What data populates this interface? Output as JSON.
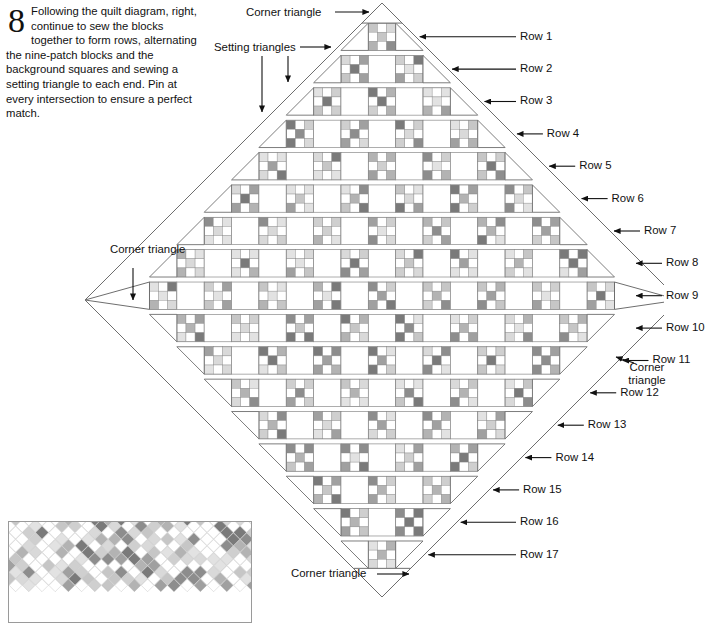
{
  "instruction": {
    "step_number": "8",
    "text": "Following the quilt diagram, right, continue to sew the blocks together to form rows, alternating the nine-patch blocks and the background squares and sewing a setting triangle to each end. Pin at every intersection to ensure a perfect match."
  },
  "annotations": {
    "corner_triangle_top": "Corner triangle",
    "setting_triangles": "Setting triangles",
    "corner_triangle_left": "Corner triangle",
    "corner_triangle_right": "Corner triangle",
    "corner_triangle_bottom": "Corner triangle"
  },
  "row_labels": [
    "Row 1",
    "Row 2",
    "Row 3",
    "Row 4",
    "Row 5",
    "Row 6",
    "Row 7",
    "Row 8",
    "Row 9",
    "Row 10",
    "Row 11",
    "Row 12",
    "Row 13",
    "Row 14",
    "Row 15",
    "Row 16",
    "Row 17"
  ],
  "colors": {
    "outline": "#6e6e6e",
    "block_outline": "#8a8a8a",
    "background_square": "#ffffff",
    "text": "#111111",
    "thumbnail_border": "#9a9a9a",
    "patch_palette": [
      "#d9d9d9",
      "#c6c6c6",
      "#b3b3b3",
      "#a0a0a0",
      "#8d8d8d",
      "#7a7a7a",
      "#e2e2e2",
      "#cfcfcf"
    ]
  },
  "chart_data": {
    "type": "diagram",
    "rows_total": 17,
    "peak_row": 9,
    "block_counts_per_row": [
      1,
      2,
      3,
      4,
      5,
      6,
      7,
      8,
      9,
      8,
      7,
      6,
      5,
      4,
      3,
      2,
      1
    ],
    "nine_patch_layout": "3x3 checkerboard, colored corners and center, white edge midpoints"
  }
}
